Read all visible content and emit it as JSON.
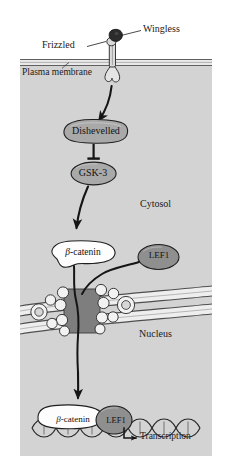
{
  "figure": {
    "compartments": {
      "extracellular_label": "",
      "cytosol_label": "Cytosol",
      "nucleus_label": "Nucleus",
      "membrane_label": "Plasma membrane"
    },
    "labels": {
      "wingless": "Wingless",
      "frizzled": "Frizzled",
      "plasma_membrane": "Plasma membrane",
      "cytosol": "Cytosol",
      "nucleus": "Nucleus",
      "transcription": "Transcription"
    },
    "nodes": {
      "dishevelled": "Dishevelled",
      "gsk3": "GSK-3",
      "beta_catenin_greek": "β",
      "beta_catenin_rest": "-catenin",
      "lef1": "LEF1"
    },
    "colors": {
      "panel_background": "#d2d2d2",
      "page_background": "#ffffff",
      "node_gray": "#a8a8a8",
      "lef1_gray": "#8f8f8f",
      "beta_catenin_white": "#fdfdfd",
      "membrane_line": "#6e6e6e",
      "membrane_fill": "#e8e8e8",
      "pore_dark": "#7d7d7d",
      "envelope_fill": "#efefef",
      "ligand_dark": "#2e2e2e",
      "receptor_light": "#e2e2e2",
      "stroke": "#1a1a1a",
      "dna_stroke": "#2a2a2a"
    },
    "interactions": [
      {
        "from": "Frizzled",
        "to": "Dishevelled",
        "type": "activation-arrow"
      },
      {
        "from": "Dishevelled",
        "to": "GSK-3",
        "type": "inhibition-bar"
      },
      {
        "from": "GSK-3",
        "to": "β-catenin",
        "type": "activation-arrow"
      },
      {
        "from": "LEF1",
        "to": "nuclear-pore",
        "type": "translocation"
      },
      {
        "from": "β-catenin",
        "to": "nuclear-pore",
        "type": "translocation"
      },
      {
        "from": "β-catenin/LEF1",
        "to": "DNA",
        "type": "transcription-arrow"
      }
    ]
  }
}
